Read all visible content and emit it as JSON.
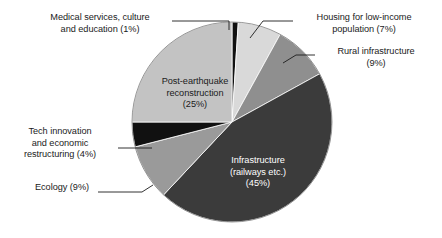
{
  "chart_data": {
    "type": "pie",
    "title": "",
    "subtitle": "",
    "xlabel": "",
    "ylabel": "",
    "legend_position": "none",
    "grid": false,
    "value_unit": "percent",
    "total": 100,
    "start_angle_deg": 0,
    "direction": "clockwise",
    "categories": [
      "Medical services, culture and education",
      "Housing for low-income population",
      "Rural infrastructure",
      "Infrastructure (railways etc.)",
      "Ecology",
      "Tech innovation and economic restructuring",
      "Post-earthquake reconstruction"
    ],
    "values": [
      1,
      7,
      9,
      45,
      9,
      4,
      25
    ],
    "slice_colors": [
      "#111111",
      "#d9d9d9",
      "#8f8f8f",
      "#3b3b3b",
      "#9a9a9a",
      "#111111",
      "#c3c3c3"
    ],
    "slices": [
      {
        "label": "Medical services, culture and education",
        "value": 1,
        "color": "#111111",
        "label_placement": "outside"
      },
      {
        "label": "Housing for low-income population",
        "value": 7,
        "color": "#d9d9d9",
        "label_placement": "outside"
      },
      {
        "label": "Rural infrastructure",
        "value": 9,
        "color": "#8f8f8f",
        "label_placement": "outside"
      },
      {
        "label": "Infrastructure (railways etc.)",
        "value": 45,
        "color": "#3b3b3b",
        "label_placement": "inside"
      },
      {
        "label": "Ecology",
        "value": 9,
        "color": "#9a9a9a",
        "label_placement": "outside"
      },
      {
        "label": "Tech innovation and economic restructuring",
        "value": 4,
        "color": "#111111",
        "label_placement": "outside"
      },
      {
        "label": "Post-earthquake reconstruction",
        "value": 25,
        "color": "#c3c3c3",
        "label_placement": "inside"
      }
    ]
  },
  "labels": {
    "medical": "Medical services, culture\nand education (1%)",
    "housing": "Housing for low-income\npopulation (7%)",
    "rural": "Rural infrastructure\n(9%)",
    "tech": "Tech innovation\nand economic\nrestructuring (4%)",
    "ecology": "Ecology (9%)",
    "post_earthquake": "Post-earthquake\nreconstruction\n(25%)",
    "infrastructure": "Infrastructure\n(railways etc.)\n(45%)"
  },
  "style": {
    "background": "#ffffff",
    "text_color": "#1b1b1b",
    "inside_dark_text_color": "#ffffff",
    "leader_line_color": "#1b1b1b",
    "slice_outline_color": "#ffffff"
  }
}
